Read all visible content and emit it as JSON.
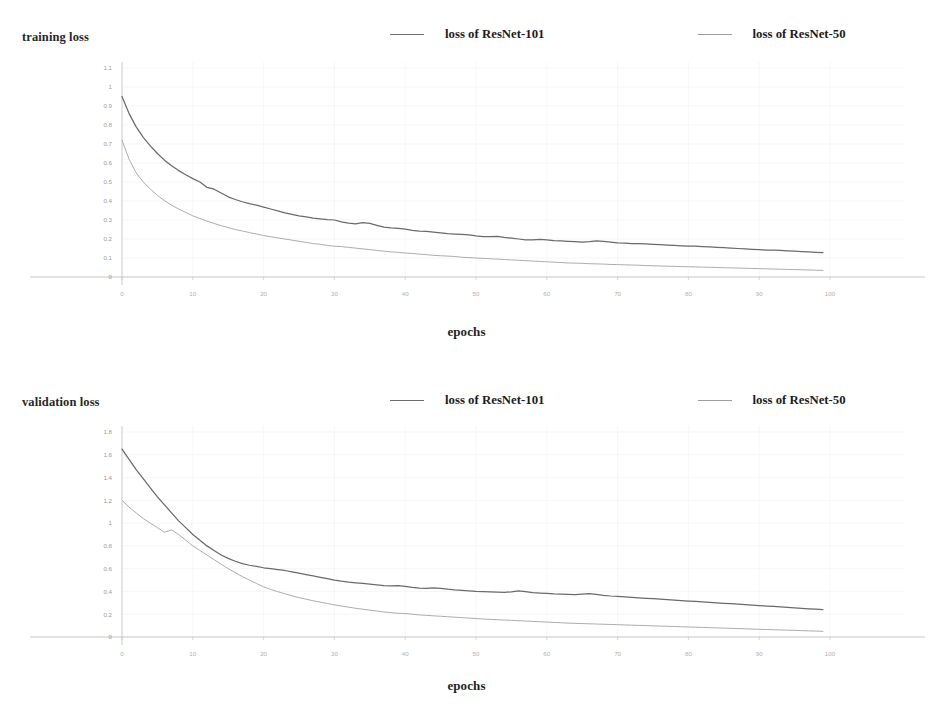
{
  "figure": {
    "background": "#ffffff",
    "series_colors": {
      "resnet101": "#6a6a6a",
      "resnet50": "#a8a8a8"
    }
  },
  "charts": [
    {
      "id": "training-loss-chart",
      "y_axis_title": "training loss",
      "x_axis_title": "epochs",
      "legend": [
        {
          "label": "loss of ResNet-101",
          "color": "#6a6a6a"
        },
        {
          "label": "loss of ResNet-50",
          "color": "#a8a8a8"
        }
      ],
      "yticks": [
        "1.1",
        "1",
        "0.9",
        "0.8",
        "0.7",
        "0.6",
        "0.5",
        "0.4",
        "0.3",
        "0.2",
        "0.1",
        "0"
      ],
      "xticks": [
        "0",
        "10",
        "20",
        "30",
        "40",
        "50",
        "60",
        "70",
        "80",
        "90",
        "100"
      ]
    },
    {
      "id": "validation-loss-chart",
      "y_axis_title": "validation loss",
      "x_axis_title": "epochs",
      "legend": [
        {
          "label": "loss of ResNet-101",
          "color": "#6a6a6a"
        },
        {
          "label": "loss of ResNet-50",
          "color": "#a8a8a8"
        }
      ],
      "yticks": [
        "1.8",
        "1.6",
        "1.4",
        "1.2",
        "1",
        "0.8",
        "0.6",
        "0.4",
        "0.2",
        "0"
      ],
      "xticks": [
        "0",
        "10",
        "20",
        "30",
        "40",
        "50",
        "60",
        "70",
        "80",
        "90",
        "100"
      ]
    }
  ],
  "chart_data": [
    {
      "type": "line",
      "title": "",
      "xlabel": "epochs",
      "ylabel": "training loss",
      "xlim": [
        0,
        100
      ],
      "ylim": [
        0,
        1.1
      ],
      "grid": true,
      "legend_position": "top-center",
      "xticks": [
        0,
        10,
        20,
        30,
        40,
        50,
        60,
        70,
        80,
        90,
        100
      ],
      "yticks": [
        0,
        0.1,
        0.2,
        0.3,
        0.4,
        0.5,
        0.6,
        0.7,
        0.8,
        0.9,
        1.0,
        1.1
      ],
      "x": [
        0,
        1,
        2,
        3,
        4,
        5,
        6,
        7,
        8,
        9,
        10,
        11,
        12,
        13,
        14,
        15,
        16,
        17,
        18,
        19,
        20,
        21,
        22,
        23,
        24,
        25,
        26,
        27,
        28,
        29,
        30,
        31,
        32,
        33,
        34,
        35,
        36,
        37,
        38,
        39,
        40,
        41,
        42,
        43,
        44,
        45,
        46,
        47,
        48,
        49,
        50,
        51,
        52,
        53,
        54,
        55,
        56,
        57,
        58,
        59,
        60,
        61,
        62,
        63,
        64,
        65,
        66,
        67,
        68,
        69,
        70,
        71,
        72,
        73,
        74,
        75,
        76,
        77,
        78,
        79,
        80,
        81,
        82,
        83,
        84,
        85,
        86,
        87,
        88,
        89,
        90,
        91,
        92,
        93,
        94,
        95,
        96,
        97,
        98,
        99
      ],
      "series": [
        {
          "name": "loss of ResNet-101",
          "color": "#6a6a6a",
          "values": [
            0.95,
            0.86,
            0.79,
            0.735,
            0.69,
            0.65,
            0.615,
            0.585,
            0.56,
            0.538,
            0.518,
            0.5,
            0.472,
            0.462,
            0.442,
            0.422,
            0.408,
            0.396,
            0.386,
            0.378,
            0.368,
            0.358,
            0.348,
            0.338,
            0.33,
            0.322,
            0.316,
            0.31,
            0.306,
            0.302,
            0.3,
            0.29,
            0.284,
            0.28,
            0.286,
            0.282,
            0.272,
            0.262,
            0.258,
            0.256,
            0.252,
            0.246,
            0.242,
            0.24,
            0.236,
            0.232,
            0.228,
            0.226,
            0.224,
            0.222,
            0.216,
            0.212,
            0.212,
            0.214,
            0.208,
            0.204,
            0.2,
            0.196,
            0.196,
            0.198,
            0.196,
            0.192,
            0.19,
            0.188,
            0.186,
            0.184,
            0.186,
            0.19,
            0.188,
            0.184,
            0.18,
            0.178,
            0.176,
            0.176,
            0.174,
            0.172,
            0.17,
            0.168,
            0.166,
            0.164,
            0.162,
            0.162,
            0.16,
            0.158,
            0.156,
            0.154,
            0.152,
            0.15,
            0.148,
            0.146,
            0.144,
            0.142,
            0.142,
            0.14,
            0.138,
            0.136,
            0.134,
            0.132,
            0.13,
            0.128
          ]
        },
        {
          "name": "loss of ResNet-50",
          "color": "#a8a8a8",
          "values": [
            0.72,
            0.62,
            0.548,
            0.5,
            0.462,
            0.43,
            0.402,
            0.378,
            0.358,
            0.34,
            0.322,
            0.308,
            0.294,
            0.282,
            0.27,
            0.26,
            0.25,
            0.242,
            0.234,
            0.226,
            0.218,
            0.212,
            0.206,
            0.2,
            0.194,
            0.188,
            0.182,
            0.176,
            0.172,
            0.166,
            0.162,
            0.16,
            0.156,
            0.152,
            0.148,
            0.144,
            0.14,
            0.136,
            0.132,
            0.13,
            0.126,
            0.124,
            0.12,
            0.118,
            0.114,
            0.112,
            0.11,
            0.108,
            0.104,
            0.102,
            0.1,
            0.098,
            0.096,
            0.094,
            0.092,
            0.09,
            0.088,
            0.086,
            0.084,
            0.082,
            0.08,
            0.078,
            0.076,
            0.074,
            0.073,
            0.072,
            0.07,
            0.069,
            0.068,
            0.066,
            0.065,
            0.064,
            0.063,
            0.062,
            0.06,
            0.059,
            0.058,
            0.057,
            0.056,
            0.055,
            0.054,
            0.053,
            0.052,
            0.051,
            0.05,
            0.049,
            0.048,
            0.047,
            0.046,
            0.045,
            0.044,
            0.043,
            0.042,
            0.041,
            0.04,
            0.039,
            0.038,
            0.037,
            0.036,
            0.035
          ]
        }
      ]
    },
    {
      "type": "line",
      "title": "",
      "xlabel": "epochs",
      "ylabel": "validation loss",
      "xlim": [
        0,
        100
      ],
      "ylim": [
        0,
        1.9
      ],
      "grid": true,
      "legend_position": "top-center",
      "xticks": [
        0,
        10,
        20,
        30,
        40,
        50,
        60,
        70,
        80,
        90,
        100
      ],
      "yticks": [
        0,
        0.2,
        0.4,
        0.6,
        0.8,
        1.0,
        1.2,
        1.4,
        1.6,
        1.8
      ],
      "x": [
        0,
        1,
        2,
        3,
        4,
        5,
        6,
        7,
        8,
        9,
        10,
        11,
        12,
        13,
        14,
        15,
        16,
        17,
        18,
        19,
        20,
        21,
        22,
        23,
        24,
        25,
        26,
        27,
        28,
        29,
        30,
        31,
        32,
        33,
        34,
        35,
        36,
        37,
        38,
        39,
        40,
        41,
        42,
        43,
        44,
        45,
        46,
        47,
        48,
        49,
        50,
        51,
        52,
        53,
        54,
        55,
        56,
        57,
        58,
        59,
        60,
        61,
        62,
        63,
        64,
        65,
        66,
        67,
        68,
        69,
        70,
        71,
        72,
        73,
        74,
        75,
        76,
        77,
        78,
        79,
        80,
        81,
        82,
        83,
        84,
        85,
        86,
        87,
        88,
        89,
        90,
        91,
        92,
        93,
        94,
        95,
        96,
        97,
        98,
        99
      ],
      "series": [
        {
          "name": "loss of ResNet-101",
          "color": "#6a6a6a",
          "values": [
            1.65,
            1.56,
            1.47,
            1.39,
            1.31,
            1.23,
            1.16,
            1.09,
            1.02,
            0.96,
            0.9,
            0.85,
            0.8,
            0.76,
            0.72,
            0.69,
            0.665,
            0.645,
            0.63,
            0.62,
            0.608,
            0.6,
            0.592,
            0.584,
            0.572,
            0.56,
            0.548,
            0.536,
            0.524,
            0.512,
            0.5,
            0.49,
            0.482,
            0.476,
            0.47,
            0.464,
            0.458,
            0.452,
            0.448,
            0.452,
            0.444,
            0.436,
            0.43,
            0.428,
            0.432,
            0.428,
            0.42,
            0.414,
            0.41,
            0.406,
            0.4,
            0.398,
            0.396,
            0.394,
            0.392,
            0.396,
            0.404,
            0.398,
            0.39,
            0.386,
            0.382,
            0.378,
            0.376,
            0.374,
            0.372,
            0.376,
            0.38,
            0.374,
            0.366,
            0.36,
            0.356,
            0.352,
            0.348,
            0.344,
            0.34,
            0.336,
            0.332,
            0.328,
            0.324,
            0.32,
            0.316,
            0.312,
            0.308,
            0.304,
            0.3,
            0.296,
            0.292,
            0.288,
            0.284,
            0.28,
            0.276,
            0.272,
            0.268,
            0.264,
            0.26,
            0.256,
            0.252,
            0.248,
            0.244,
            0.24
          ]
        },
        {
          "name": "loss of ResNet-50",
          "color": "#a8a8a8",
          "values": [
            1.2,
            1.14,
            1.09,
            1.04,
            1.0,
            0.96,
            0.92,
            0.94,
            0.9,
            0.85,
            0.8,
            0.76,
            0.72,
            0.68,
            0.64,
            0.6,
            0.565,
            0.53,
            0.5,
            0.47,
            0.44,
            0.418,
            0.398,
            0.38,
            0.362,
            0.346,
            0.332,
            0.318,
            0.306,
            0.294,
            0.282,
            0.272,
            0.262,
            0.252,
            0.244,
            0.236,
            0.228,
            0.22,
            0.214,
            0.208,
            0.206,
            0.2,
            0.194,
            0.19,
            0.186,
            0.182,
            0.178,
            0.174,
            0.17,
            0.166,
            0.162,
            0.158,
            0.155,
            0.152,
            0.149,
            0.146,
            0.143,
            0.14,
            0.137,
            0.134,
            0.131,
            0.128,
            0.125,
            0.122,
            0.12,
            0.118,
            0.116,
            0.114,
            0.112,
            0.11,
            0.108,
            0.106,
            0.104,
            0.102,
            0.1,
            0.098,
            0.096,
            0.094,
            0.092,
            0.09,
            0.088,
            0.086,
            0.084,
            0.082,
            0.08,
            0.078,
            0.076,
            0.074,
            0.072,
            0.07,
            0.068,
            0.066,
            0.064,
            0.062,
            0.06,
            0.058,
            0.056,
            0.054,
            0.052,
            0.05
          ]
        }
      ]
    }
  ]
}
